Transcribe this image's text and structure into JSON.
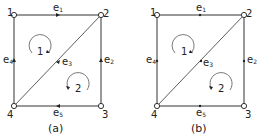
{
  "panels": [
    {
      "caption": "(a)",
      "offset_x": 0,
      "directed": true,
      "nodes": [
        {
          "id": "1",
          "label": "1"
        },
        {
          "id": "2",
          "label": "2"
        },
        {
          "id": "3",
          "label": "3"
        },
        {
          "id": "4",
          "label": "4"
        }
      ],
      "edges": [
        {
          "id": "e1",
          "label": "e1",
          "from": "1",
          "to": "2"
        },
        {
          "id": "e2",
          "label": "e2",
          "from": "3",
          "to": "2"
        },
        {
          "id": "e3",
          "label": "e3",
          "from": "4",
          "to": "2"
        },
        {
          "id": "e4",
          "label": "e4",
          "from": "4",
          "to": "1"
        },
        {
          "id": "e5",
          "label": "e5",
          "from": "3",
          "to": "4"
        }
      ],
      "loops": [
        {
          "label": "1",
          "direction": "clockwise"
        },
        {
          "label": "2",
          "direction": "counterclockwise"
        }
      ]
    },
    {
      "caption": "(b)",
      "offset_x": 143,
      "directed": false,
      "nodes": [
        {
          "id": "1",
          "label": "1"
        },
        {
          "id": "2",
          "label": "2"
        },
        {
          "id": "3",
          "label": "3"
        },
        {
          "id": "4",
          "label": "4"
        }
      ],
      "edges": [
        {
          "id": "e1",
          "label": "e1"
        },
        {
          "id": "e2",
          "label": "e2"
        },
        {
          "id": "e3",
          "label": "e3"
        },
        {
          "id": "e4",
          "label": "e4"
        },
        {
          "id": "e5",
          "label": "e5"
        }
      ],
      "loops": [
        {
          "label": "1",
          "direction": "clockwise"
        },
        {
          "label": "2",
          "direction": "counterclockwise"
        }
      ]
    }
  ],
  "colors": {
    "stroke": "#333333",
    "background": "#ffffff"
  }
}
